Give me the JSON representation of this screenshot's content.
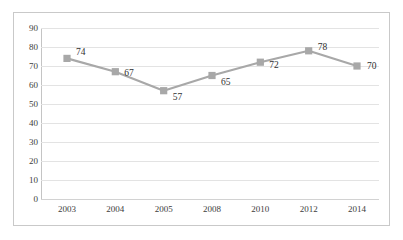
{
  "chart_data": {
    "type": "line",
    "title": "",
    "subtitle": "",
    "xlabel": "",
    "ylabel": "",
    "categories": [
      "2003",
      "2004",
      "2005",
      "2008",
      "2010",
      "2012",
      "2014"
    ],
    "values": [
      74,
      67,
      57,
      65,
      72,
      78,
      70
    ],
    "series": [
      {
        "name": "",
        "values": [
          74,
          67,
          57,
          65,
          72,
          78,
          70
        ]
      }
    ],
    "point_labels": [
      "74",
      "67",
      "57",
      "65",
      "72",
      "78",
      "70"
    ],
    "ylim": [
      0,
      90
    ],
    "ytick_labels": [
      "90",
      "80",
      "70",
      "60",
      "50",
      "40",
      "30",
      "20",
      "10",
      "0"
    ],
    "ytick_values": [
      90,
      80,
      70,
      60,
      50,
      40,
      30,
      20,
      10,
      0
    ],
    "ytick_step": 10,
    "grid": true,
    "grid_axis": "y",
    "legend": false,
    "legend_position": "none",
    "marker": "square",
    "colors": {
      "line": "#a8a8a8",
      "marker": "#a8a8a8",
      "gridline": "#e3e3e3",
      "axis": "#c4c4c4",
      "frame": "#c9c9c9",
      "background": "#ffffff",
      "text": "#3d3d3d"
    }
  }
}
